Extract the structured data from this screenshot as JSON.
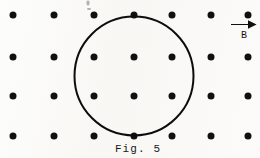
{
  "figure": {
    "caption": "Fig. 5",
    "caption_x": 138,
    "caption_y": 143,
    "background_color": "#fbfaf8",
    "ink_color": "#111010"
  },
  "field": {
    "symbol_label": "B",
    "direction": "right",
    "arrow_x": 244,
    "arrow_y": 30,
    "arrow_width": 26,
    "arrow_color": "#111010"
  },
  "grid": {
    "description": "uniform array of dots representing magnetic field into/out of page",
    "dot_color": "#111010",
    "dot_diameter": 7,
    "columns_x": [
      13,
      54,
      94,
      134,
      172,
      211,
      248
    ],
    "rows_y": [
      15,
      57,
      96,
      136
    ],
    "dots": [
      {
        "x": 13,
        "y": 15
      },
      {
        "x": 54,
        "y": 15
      },
      {
        "x": 94,
        "y": 15
      },
      {
        "x": 134,
        "y": 15
      },
      {
        "x": 172,
        "y": 15
      },
      {
        "x": 211,
        "y": 15
      },
      {
        "x": 248,
        "y": 15
      },
      {
        "x": 13,
        "y": 57
      },
      {
        "x": 54,
        "y": 57
      },
      {
        "x": 94,
        "y": 57
      },
      {
        "x": 134,
        "y": 57
      },
      {
        "x": 172,
        "y": 57
      },
      {
        "x": 211,
        "y": 57
      },
      {
        "x": 248,
        "y": 57
      },
      {
        "x": 13,
        "y": 96
      },
      {
        "x": 54,
        "y": 96
      },
      {
        "x": 94,
        "y": 96
      },
      {
        "x": 134,
        "y": 96
      },
      {
        "x": 172,
        "y": 96
      },
      {
        "x": 211,
        "y": 96
      },
      {
        "x": 248,
        "y": 96
      },
      {
        "x": 13,
        "y": 136
      },
      {
        "x": 54,
        "y": 136
      },
      {
        "x": 94,
        "y": 136
      },
      {
        "x": 134,
        "y": 136
      },
      {
        "x": 172,
        "y": 136
      },
      {
        "x": 211,
        "y": 136
      },
      {
        "x": 248,
        "y": 136
      }
    ]
  },
  "loop": {
    "shape": "circle",
    "center_x": 133.5,
    "center_y": 75.5,
    "radius": 60.5,
    "stroke_width": 2.4,
    "stroke_color": "#0d0d0d"
  },
  "artifacts": [
    {
      "x": 88,
      "y": 3,
      "w": 3,
      "h": 5
    },
    {
      "x": 89,
      "y": 9,
      "w": 4,
      "h": 2
    }
  ]
}
